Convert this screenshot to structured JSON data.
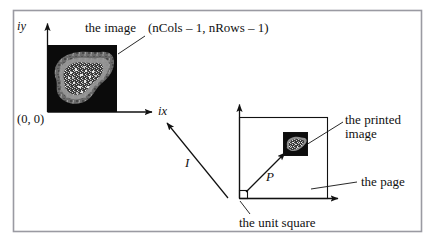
{
  "figure": {
    "background_color": "#ffffff",
    "frame_color": "#9a9aa2",
    "ink_color": "#111111",
    "width": 435,
    "height": 246
  },
  "image_space": {
    "y_axis_label": "iy",
    "x_axis_label": "ix",
    "origin_label": "(0, 0)",
    "image_label": "the image",
    "far_corner_label": "(nCols – 1, nRows – 1)",
    "thumbnail_name": "fractal-image-thumbnail"
  },
  "page_space": {
    "page_label": "the page",
    "printed_image_label": "the printed\nimage",
    "printed_image_label_line1": "the printed",
    "printed_image_label_line2": "image",
    "unit_square_label": "the unit square",
    "thumbnail_name": "printed-image-thumbnail"
  },
  "mappings": {
    "image_arrow_label": "I",
    "page_arrow_label": "P"
  }
}
